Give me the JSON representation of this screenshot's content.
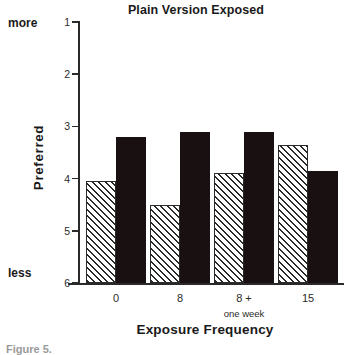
{
  "chart_data": {
    "type": "bar",
    "title": "Plain Version Exposed",
    "xlabel": "Exposure Frequency",
    "ylabel": "Preferred",
    "categories": [
      "0",
      "8",
      "8 +",
      "15"
    ],
    "category_sublabels": [
      "",
      "",
      "one week",
      ""
    ],
    "series": [
      {
        "name": "hatched",
        "values": [
          4.05,
          4.5,
          3.9,
          3.35
        ]
      },
      {
        "name": "solid",
        "values": [
          3.2,
          3.1,
          3.1,
          3.85
        ]
      }
    ],
    "ylim": [
      1,
      6
    ],
    "y_inverted": true,
    "yticks": [
      "1",
      "2",
      "3",
      "4",
      "5",
      "6"
    ],
    "y_anchor_high": "more",
    "y_anchor_low": "less",
    "grid": false,
    "legend": "none",
    "colors": {
      "hatched": "#ffffff",
      "hatched_line": "#2a2a2a",
      "solid": "#191111",
      "axis": "#2a2a2a"
    }
  },
  "caption": "Figure 5."
}
